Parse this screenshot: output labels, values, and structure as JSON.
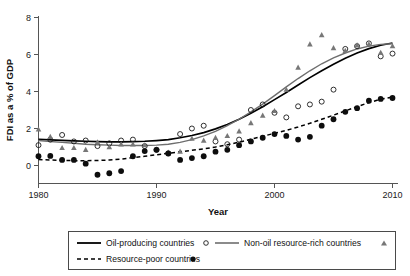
{
  "chart_data": {
    "type": "scatter",
    "title": "",
    "xlabel": "Year",
    "ylabel": "FDI as a % of GDP",
    "xlim": [
      1980,
      2010
    ],
    "ylim": [
      -1,
      8
    ],
    "grid": false,
    "xticks": [
      1980,
      1990,
      2000,
      2010
    ],
    "yticks": [
      0,
      2,
      4,
      6,
      8
    ],
    "legend_position": "below-plot",
    "series": [
      {
        "name": "Oil-producing countries",
        "marker": "open-circle",
        "line": "solid-black",
        "color": "#000000",
        "x": [
          1980,
          1981,
          1982,
          1983,
          1984,
          1985,
          1986,
          1987,
          1988,
          1989,
          1990,
          1991,
          1992,
          1993,
          1994,
          1995,
          1996,
          1997,
          1998,
          1999,
          2000,
          2001,
          2002,
          2003,
          2004,
          2005,
          2006,
          2007,
          2008,
          2009,
          2010
        ],
        "values": [
          1.1,
          1.4,
          1.65,
          1.3,
          1.35,
          1.05,
          1.2,
          1.35,
          1.4,
          1.05,
          0.85,
          0.65,
          1.7,
          2.0,
          2.15,
          1.3,
          1.15,
          1.4,
          3.0,
          3.3,
          2.85,
          2.6,
          3.2,
          3.3,
          3.45,
          4.1,
          6.3,
          6.45,
          6.6,
          5.9,
          6.05
        ],
        "fit": [
          1.42,
          1.39,
          1.36,
          1.33,
          1.31,
          1.29,
          1.28,
          1.28,
          1.29,
          1.31,
          1.35,
          1.4,
          1.5,
          1.62,
          1.78,
          1.98,
          2.22,
          2.5,
          2.82,
          3.18,
          3.56,
          3.95,
          4.35,
          4.75,
          5.12,
          5.47,
          5.8,
          6.08,
          6.32,
          6.5,
          6.62
        ]
      },
      {
        "name": "Non-oil resource-rich countries",
        "marker": "filled-triangle",
        "line": "solid-gray",
        "color": "#777777",
        "x": [
          1980,
          1981,
          1982,
          1983,
          1984,
          1985,
          1986,
          1987,
          1988,
          1989,
          1990,
          1991,
          1992,
          1993,
          1994,
          1995,
          1996,
          1997,
          1998,
          1999,
          2000,
          2001,
          2002,
          2003,
          2004,
          2005,
          2006,
          2007,
          2008,
          2009,
          2010
        ],
        "values": [
          1.95,
          1.55,
          0.95,
          0.95,
          0.85,
          1.25,
          1.0,
          1.15,
          1.15,
          1.1,
          0.85,
          0.7,
          0.75,
          1.45,
          1.35,
          1.5,
          1.6,
          1.85,
          2.3,
          2.7,
          2.95,
          4.1,
          5.3,
          6.55,
          7.05,
          6.35,
          6.2,
          6.5,
          6.55,
          6.1,
          6.45
        ],
        "fit": [
          1.35,
          1.3,
          1.25,
          1.2,
          1.15,
          1.12,
          1.1,
          1.08,
          1.08,
          1.08,
          1.1,
          1.15,
          1.25,
          1.4,
          1.6,
          1.85,
          2.15,
          2.5,
          2.9,
          3.32,
          3.78,
          4.25,
          4.7,
          5.12,
          5.5,
          5.82,
          6.08,
          6.3,
          6.45,
          6.55,
          6.58
        ]
      },
      {
        "name": "Resource-poor countries",
        "marker": "filled-circle",
        "line": "dashed-black",
        "color": "#000000",
        "x": [
          1980,
          1981,
          1982,
          1983,
          1984,
          1985,
          1986,
          1987,
          1988,
          1989,
          1990,
          1991,
          1992,
          1993,
          1994,
          1995,
          1996,
          1997,
          1998,
          1999,
          2000,
          2001,
          2002,
          2003,
          2004,
          2005,
          2006,
          2007,
          2008,
          2009,
          2010
        ],
        "values": [
          0.5,
          0.52,
          0.3,
          0.3,
          0.1,
          -0.5,
          -0.42,
          -0.3,
          0.5,
          0.78,
          0.85,
          0.65,
          0.3,
          0.4,
          0.5,
          0.75,
          0.85,
          1.1,
          1.3,
          1.5,
          1.7,
          1.6,
          1.4,
          1.55,
          2.15,
          2.5,
          2.9,
          3.1,
          3.5,
          3.6,
          3.65
        ],
        "fit": [
          0.32,
          0.3,
          0.28,
          0.26,
          0.26,
          0.27,
          0.3,
          0.35,
          0.42,
          0.5,
          0.58,
          0.66,
          0.74,
          0.82,
          0.9,
          1.0,
          1.12,
          1.26,
          1.42,
          1.58,
          1.74,
          1.9,
          2.08,
          2.28,
          2.5,
          2.72,
          2.95,
          3.18,
          3.4,
          3.58,
          3.7
        ]
      }
    ]
  },
  "legend": {
    "entries": [
      {
        "label": "Oil-producing countries",
        "marker": "open-circle",
        "line": "solid-black"
      },
      {
        "label": "Non-oil resource-rich countries",
        "marker": "filled-triangle",
        "line": "solid-gray"
      },
      {
        "label": "Resource-poor countries",
        "marker": "filled-circle",
        "line": "dashed-black"
      }
    ]
  },
  "colors": {
    "oil_line": "#000000",
    "nonoil_line": "#6e6e6e",
    "poor_line": "#000000",
    "axis": "#555555",
    "text": "#111111",
    "background": "#ffffff"
  }
}
